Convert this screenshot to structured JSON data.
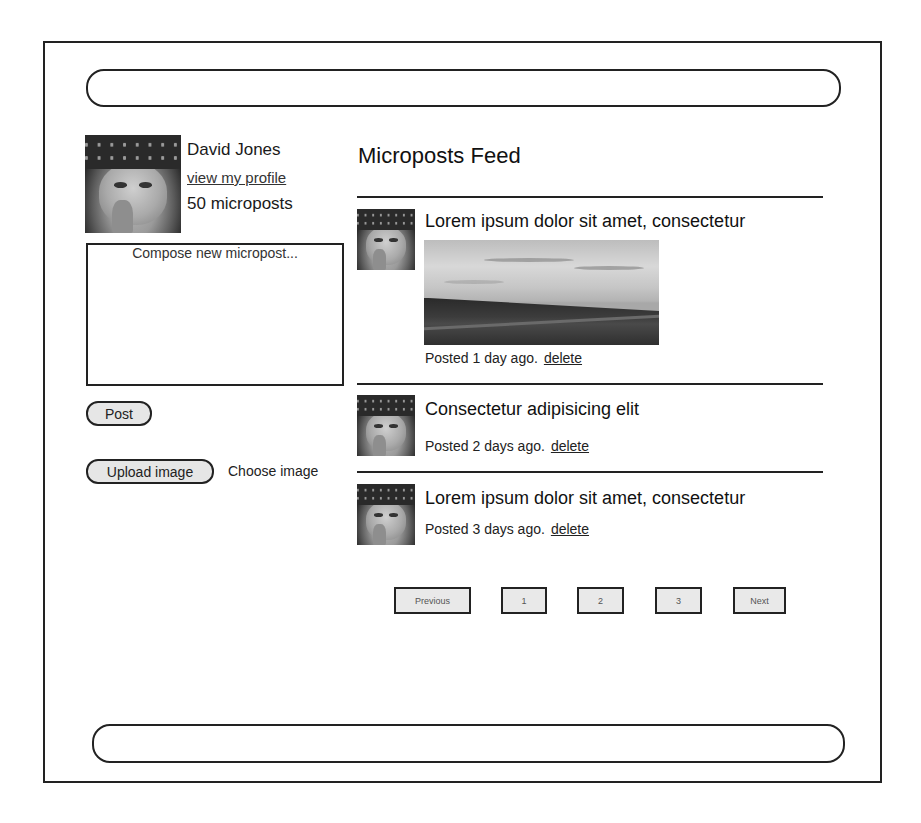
{
  "profile": {
    "name": "David Jones",
    "profile_link": "view my profile",
    "micropost_count": "50 microposts",
    "avatar_icon": "user-avatar-photo"
  },
  "compose": {
    "placeholder": "Compose new micropost...",
    "value": "",
    "post_button": "Post",
    "upload_button": "Upload image",
    "choose_image_label": "Choose image"
  },
  "feed": {
    "title": "Microposts Feed",
    "posts": [
      {
        "text": "Lorem ipsum dolor sit amet, consectetur",
        "has_image": true,
        "image_desc": "landscape-photo",
        "posted": "Posted 1 day ago.",
        "delete_label": "delete"
      },
      {
        "text": "Consectetur adipisicing elit",
        "has_image": false,
        "posted": "Posted 2 days ago.",
        "delete_label": "delete"
      },
      {
        "text": "Lorem ipsum dolor sit amet, consectetur",
        "has_image": false,
        "posted": "Posted 3 days ago.",
        "delete_label": "delete"
      }
    ]
  },
  "pagination": {
    "previous": "Previous",
    "pages": [
      "1",
      "2",
      "3"
    ],
    "next": "Next"
  },
  "colors": {
    "border": "#222222",
    "button_fill": "#e6e6e6",
    "background": "#ffffff"
  }
}
